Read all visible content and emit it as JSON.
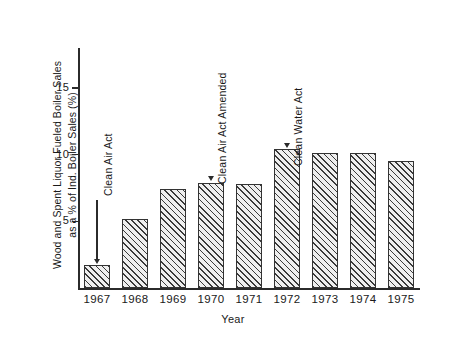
{
  "chart_data": {
    "type": "bar",
    "title": "",
    "xlabel": "Year",
    "ylabel": "Wood and Spent Liquor Fueled Boiler Sales as a % of Ind. Boiler Sales (%)",
    "ylabel_lines": [
      "Wood and Spent Liquor Fueled Boiler Sales",
      "as a % of Ind. Boiler Sales (%)"
    ],
    "categories": [
      "1967",
      "1968",
      "1969",
      "1970",
      "1971",
      "1972",
      "1973",
      "1974",
      "1975"
    ],
    "values": [
      1.7,
      5.2,
      7.4,
      7.9,
      7.8,
      10.4,
      10.1,
      10.1,
      9.5
    ],
    "ylim": [
      0,
      17.5
    ],
    "yticks": [
      5,
      10,
      15
    ],
    "ytick_labels": [
      "5",
      "10",
      "15"
    ],
    "grid": false,
    "legend": "none",
    "bar_fill": "hatch-45",
    "bar_edge_color": "#333333",
    "axis_color": "#2b2b2b",
    "background": "#ffffff",
    "annotations": [
      {
        "text": "Clean Air Act",
        "target_category": "1967",
        "target_value": 1.7
      },
      {
        "text": "Clean Air Act Amended",
        "target_category": "1970",
        "target_value": 7.9
      },
      {
        "text": "Clean Water Act",
        "target_category": "1972",
        "target_value": 10.4
      }
    ]
  }
}
